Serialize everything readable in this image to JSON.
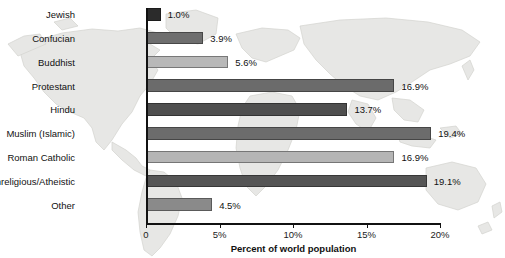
{
  "chart_data": {
    "type": "bar",
    "orientation": "horizontal",
    "title": "",
    "xlabel": "Percent of world population",
    "ylabel": "",
    "xlim": [
      0,
      20
    ],
    "xticks": [
      "0",
      "5%",
      "10%",
      "15%",
      "20%"
    ],
    "xtick_values": [
      0,
      5,
      10,
      15,
      20
    ],
    "grid": false,
    "legend": "none",
    "background": "faint world map",
    "categories": [
      "Jewish",
      "Confucian",
      "Buddhist",
      "Protestant",
      "Hindu",
      "Muslim (Islamic)",
      "Roman Catholic",
      "Nonreligious/Atheistic",
      "Other"
    ],
    "values": [
      1.0,
      3.9,
      5.6,
      16.9,
      13.7,
      19.4,
      16.9,
      19.1,
      4.5
    ],
    "value_labels": [
      "1.0%",
      "3.9%",
      "5.6%",
      "16.9%",
      "13.7%",
      "19.4%",
      "16.9%",
      "19.1%",
      "4.5%"
    ],
    "bar_colors": [
      "#2b2b2b",
      "#6e6e6e",
      "#b8b8b8",
      "#6b6b6b",
      "#4f4f4f",
      "#6c6c6c",
      "#b5b5b5",
      "#555555",
      "#8a8a8a"
    ],
    "bars": [
      {
        "label": "Jewish",
        "value": 1.0,
        "value_label": "1.0%",
        "color": "#2b2b2b"
      },
      {
        "label": "Confucian",
        "value": 3.9,
        "value_label": "3.9%",
        "color": "#6e6e6e"
      },
      {
        "label": "Buddhist",
        "value": 5.6,
        "value_label": "5.6%",
        "color": "#b8b8b8"
      },
      {
        "label": "Protestant",
        "value": 16.9,
        "value_label": "16.9%",
        "color": "#6b6b6b"
      },
      {
        "label": "Hindu",
        "value": 13.7,
        "value_label": "13.7%",
        "color": "#4f4f4f"
      },
      {
        "label": "Muslim (Islamic)",
        "value": 19.4,
        "value_label": "19.4%",
        "color": "#6c6c6c"
      },
      {
        "label": "Roman Catholic",
        "value": 16.9,
        "value_label": "16.9%",
        "color": "#b5b5b5"
      },
      {
        "label": "Nonreligious/Atheistic",
        "value": 19.1,
        "value_label": "19.1%",
        "color": "#555555"
      },
      {
        "label": "Other",
        "value": 4.5,
        "value_label": "4.5%",
        "color": "#8a8a8a"
      }
    ],
    "colors": {
      "axis": "#111111",
      "text": "#111111",
      "map_fill": "#e6e6e4",
      "map_stroke": "#cfcfcc",
      "page_background": "#ffffff"
    }
  }
}
